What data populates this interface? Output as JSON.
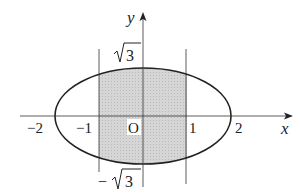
{
  "diagram": {
    "axes": {
      "x_label": "x",
      "y_label": "y",
      "origin_label": "O"
    },
    "x_ticks": [
      {
        "value": -2,
        "label": "−2"
      },
      {
        "value": -1,
        "label": "−1"
      },
      {
        "value": 1,
        "label": "1"
      },
      {
        "value": 2,
        "label": "2"
      }
    ],
    "y_ticks": [
      {
        "value": 1.732,
        "label": "√3",
        "radicand": "3",
        "sign": ""
      },
      {
        "value": -1.732,
        "label": "−√3",
        "radicand": "3",
        "sign": "−"
      }
    ],
    "ellipse": {
      "a": 2,
      "b": 1.732
    },
    "vertical_lines": [
      -1,
      1
    ],
    "shaded_region": {
      "x_from": -1,
      "x_to": 1,
      "bounded_by": "ellipse"
    },
    "colors": {
      "stroke": "#222222",
      "shade": "#d4d4d4",
      "background": "#ffffff"
    }
  }
}
